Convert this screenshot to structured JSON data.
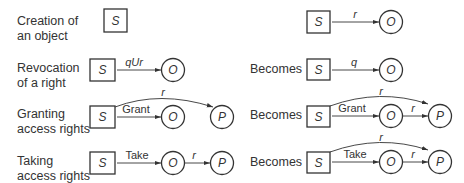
{
  "rows": [
    {
      "description_line1": "Creation of",
      "description_line2": "an object",
      "before": {
        "nodes": [
          "S"
        ],
        "edges": []
      },
      "becomes_label": "",
      "after": {
        "nodes": [
          "S",
          "O"
        ],
        "edges": [
          {
            "from": "S",
            "to": "O",
            "label": "r"
          }
        ]
      }
    },
    {
      "description_line1": "Revocation",
      "description_line2": "of a right",
      "before": {
        "nodes": [
          "S",
          "O"
        ],
        "edges": [
          {
            "from": "S",
            "to": "O",
            "label": "qUr"
          }
        ]
      },
      "becomes_label": "Becomes",
      "after": {
        "nodes": [
          "S",
          "O"
        ],
        "edges": [
          {
            "from": "S",
            "to": "O",
            "label": "q"
          }
        ]
      }
    },
    {
      "description_line1": "Granting",
      "description_line2": "access rights",
      "before": {
        "nodes": [
          "S",
          "O",
          "P"
        ],
        "edges": [
          {
            "from": "S",
            "to": "O",
            "label": "Grant"
          },
          {
            "from": "S",
            "to": "P",
            "label": "r"
          }
        ]
      },
      "becomes_label": "Becomes",
      "after": {
        "nodes": [
          "S",
          "O",
          "P"
        ],
        "edges": [
          {
            "from": "S",
            "to": "O",
            "label": "Grant"
          },
          {
            "from": "S",
            "to": "P",
            "label": "r"
          },
          {
            "from": "O",
            "to": "P",
            "label": "r"
          }
        ]
      }
    },
    {
      "description_line1": "Taking",
      "description_line2": "access rights",
      "before": {
        "nodes": [
          "S",
          "O",
          "P"
        ],
        "edges": [
          {
            "from": "S",
            "to": "O",
            "label": "Take"
          },
          {
            "from": "O",
            "to": "P",
            "label": "r"
          }
        ]
      },
      "becomes_label": "Becomes",
      "after": {
        "nodes": [
          "S",
          "O",
          "P"
        ],
        "edges": [
          {
            "from": "S",
            "to": "O",
            "label": "Take"
          },
          {
            "from": "O",
            "to": "P",
            "label": "r"
          },
          {
            "from": "S",
            "to": "P",
            "label": "r"
          }
        ]
      }
    }
  ]
}
